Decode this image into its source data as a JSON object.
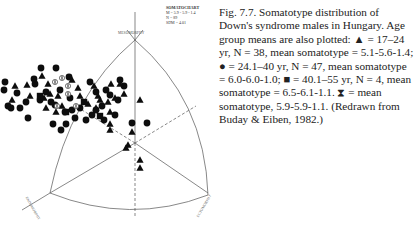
{
  "chart_data": {
    "type": "scatter",
    "title": "SOMATOCHART",
    "legend_box": {
      "title": "SOMATOCHART",
      "lines": [
        "M = 5.9 - 5.9 - 1.4",
        "N = 89",
        "SDM = 4.01"
      ]
    },
    "axes": {
      "top": "MESOMORPHY",
      "left": "ENDOMORPHY",
      "right": "ECTOMORPHY"
    },
    "series": [
      {
        "name": "17-24 yr",
        "marker": "triangle",
        "n": 38,
        "mean_somatotype": "5.1-5.6-1.4"
      },
      {
        "name": "24.1-40 yr",
        "marker": "circle",
        "n": 47,
        "mean_somatotype": "6.0-6.0-1.0"
      },
      {
        "name": "40.1-55 yr",
        "marker": "square",
        "n": 4,
        "mean_somatotype": "6.5-6.1-1.1"
      },
      {
        "name": "mean",
        "marker": "hourglass",
        "mean_somatotype": "5.9-5.9-1.1"
      }
    ],
    "points": {
      "circles": [
        [
          5,
          82
        ],
        [
          4,
          90
        ],
        [
          8,
          106
        ],
        [
          11,
          108
        ],
        [
          17,
          93
        ],
        [
          20,
          108
        ],
        [
          26,
          102
        ],
        [
          28,
          118
        ],
        [
          35,
          84
        ],
        [
          41,
          68
        ],
        [
          56,
          68
        ],
        [
          34,
          79
        ],
        [
          46,
          92
        ],
        [
          55,
          105
        ],
        [
          69,
          77
        ],
        [
          70,
          98
        ],
        [
          65,
          112
        ],
        [
          53,
          124
        ],
        [
          61,
          130
        ],
        [
          66,
          124
        ],
        [
          75,
          118
        ],
        [
          90,
          82
        ],
        [
          92,
          115
        ],
        [
          102,
          106
        ],
        [
          96,
          92
        ],
        [
          106,
          90
        ],
        [
          115,
          115
        ],
        [
          124,
          86
        ],
        [
          132,
          123
        ],
        [
          147,
          123
        ],
        [
          104,
          120
        ],
        [
          110,
          95
        ],
        [
          86,
          120
        ],
        [
          51,
          102
        ],
        [
          40,
          100
        ],
        [
          80,
          108
        ],
        [
          60,
          90
        ],
        [
          72,
          110
        ],
        [
          96,
          110
        ],
        [
          118,
          100
        ],
        [
          120,
          80
        ]
      ],
      "triangles": [
        [
          15,
          86
        ],
        [
          27,
          85
        ],
        [
          12,
          100
        ],
        [
          30,
          96
        ],
        [
          42,
          76
        ],
        [
          48,
          84
        ],
        [
          44,
          98
        ],
        [
          50,
          94
        ],
        [
          58,
          96
        ],
        [
          62,
          106
        ],
        [
          46,
          108
        ],
        [
          72,
          80
        ],
        [
          78,
          88
        ],
        [
          94,
          86
        ],
        [
          98,
          96
        ],
        [
          100,
          100
        ],
        [
          108,
          102
        ],
        [
          111,
          84
        ],
        [
          115,
          98
        ],
        [
          96,
          108
        ],
        [
          110,
          112
        ],
        [
          120,
          84
        ],
        [
          124,
          94
        ],
        [
          140,
          100
        ],
        [
          110,
          124
        ],
        [
          110,
          130
        ],
        [
          132,
          132
        ],
        [
          128,
          145
        ],
        [
          140,
          160
        ],
        [
          140,
          168
        ],
        [
          126,
          148
        ],
        [
          56,
          112
        ],
        [
          80,
          96
        ],
        [
          88,
          104
        ]
      ],
      "squares": [
        [
          40,
          96
        ],
        [
          84,
          102
        ],
        [
          66,
          112
        ],
        [
          100,
          116
        ]
      ],
      "hourglass_means": [
        [
          55,
          82
        ],
        [
          62,
          78
        ],
        [
          68,
          86
        ],
        [
          68,
          94
        ],
        [
          57,
          106
        ],
        [
          76,
          106
        ]
      ]
    }
  },
  "caption": {
    "text": "Fig. 7.7. Somatotype distribution of Down's syndrome males in Hungary. Age group means are also plotted: ▲ = 17–24 yr, N = 38, mean somatotype = 5.1-5.6-1.4; ● = 24.1–40 yr, N = 47, mean somatotype = 6.0-6.0-1.0; ■ = 40.1–55 yr, N = 4, mean somatotype = 6.5-6.1-1.1. ⧗ = mean somatotype, 5.9-5.9-1.1. (Redrawn from Buday & Eiben, 1982.)"
  }
}
